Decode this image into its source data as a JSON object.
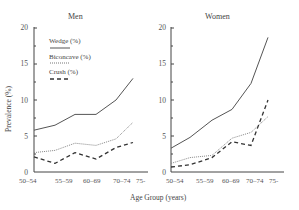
{
  "figure": {
    "xlabel": "Age Group (years)",
    "ylabel": "Prevalence (%)"
  },
  "legend": {
    "items": [
      {
        "label": "Wedge (%)",
        "style": "solid"
      },
      {
        "label": "Biconcave (%)",
        "style": "dotted"
      },
      {
        "label": "Crush (%)",
        "style": "dashed"
      }
    ]
  },
  "colors": {
    "line": "#555555",
    "axis": "#444444"
  },
  "chart_data": [
    {
      "type": "line",
      "title": "Men",
      "xlabel": "Age Group (years)",
      "ylabel": "Prevalence (%)",
      "ylim": [
        0,
        20
      ],
      "yticks": [
        0,
        5,
        10,
        15,
        20
      ],
      "tick_labels": [
        "50–54",
        "55–59",
        "60–69",
        "70–74",
        "75-"
      ],
      "x": [
        0,
        1,
        2,
        3,
        4,
        5
      ],
      "grid": false,
      "legend_position": "upper left",
      "series": [
        {
          "name": "Wedge (%)",
          "style": "solid",
          "values": [
            5.8,
            6.5,
            8.0,
            8.0,
            10.0,
            13.0
          ]
        },
        {
          "name": "Biconcave (%)",
          "style": "dotted",
          "values": [
            2.7,
            3.0,
            4.0,
            3.7,
            4.6,
            6.9
          ]
        },
        {
          "name": "Crush (%)",
          "style": "dashed",
          "values": [
            2.1,
            1.2,
            2.7,
            1.8,
            3.4,
            4.1
          ]
        }
      ]
    },
    {
      "type": "line",
      "title": "Women",
      "xlabel": "Age Group (years)",
      "ylabel": "Prevalence (%)",
      "ylim": [
        0,
        20
      ],
      "yticks": [
        0,
        5,
        10,
        15,
        20
      ],
      "tick_labels": [
        "50–54",
        "55–59",
        "60–69",
        "70–74",
        "75-"
      ],
      "x": [
        0,
        1,
        2,
        3,
        4,
        5
      ],
      "grid": false,
      "series": [
        {
          "name": "Wedge (%)",
          "style": "solid",
          "values": [
            3.3,
            4.8,
            7.2,
            8.7,
            12.3,
            18.7
          ]
        },
        {
          "name": "Biconcave (%)",
          "style": "dotted",
          "values": [
            1.2,
            2.0,
            2.3,
            4.7,
            5.5,
            7.7
          ]
        },
        {
          "name": "Crush (%)",
          "style": "dashed",
          "values": [
            0.7,
            1.0,
            2.0,
            4.2,
            3.7,
            10.0
          ]
        }
      ]
    }
  ]
}
